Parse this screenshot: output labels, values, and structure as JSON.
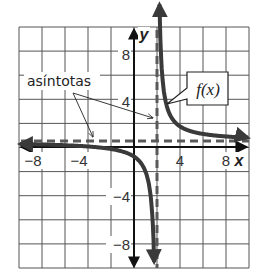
{
  "chart_data": {
    "type": "line",
    "title": "",
    "xlabel": "x",
    "ylabel": "y",
    "xlim": [
      -10,
      10
    ],
    "ylim": [
      -10,
      10
    ],
    "grid": true,
    "grid_step": 2,
    "x_ticks": [
      -8,
      -4,
      4,
      8
    ],
    "y_ticks": [
      8,
      4,
      -4,
      -8
    ],
    "x_tick_labels": [
      "−8",
      "−4",
      "4",
      "8"
    ],
    "y_tick_labels": [
      "8",
      "4",
      "−4",
      "−8"
    ],
    "series": [
      {
        "name": "f(x)",
        "style": "solid thick",
        "description": "rational function with vertical asymptote x = 2 and horizontal asymptote y ≈ 0.5",
        "approx_formula": "f(x) = 2.5/(x - 2) + 0.5",
        "points_left_branch": [
          [
            -10,
            0.29
          ],
          [
            -8,
            0.25
          ],
          [
            -4,
            0.08
          ],
          [
            -2,
            -0.13
          ],
          [
            0,
            -0.75
          ],
          [
            1,
            -2.0
          ],
          [
            1.5,
            -4.5
          ],
          [
            1.75,
            -9.5
          ]
        ],
        "points_right_branch": [
          [
            2.25,
            10.5
          ],
          [
            2.5,
            5.5
          ],
          [
            3,
            3.0
          ],
          [
            4,
            1.75
          ],
          [
            6,
            1.13
          ],
          [
            8,
            0.92
          ],
          [
            10,
            0.81
          ]
        ]
      }
    ],
    "asymptotes": [
      {
        "type": "vertical",
        "x": 2,
        "style": "dashed"
      },
      {
        "type": "horizontal",
        "y": 0.5,
        "style": "dashed"
      }
    ],
    "annotations": [
      {
        "text": "asíntotas",
        "points_to": [
          "vertical asymptote",
          "horizontal asymptote"
        ]
      },
      {
        "text": "f(x)",
        "points_to": "curve",
        "boxed": true
      }
    ],
    "legend": "none"
  },
  "labels": {
    "x_axis": "x",
    "y_axis": "y",
    "asymptotes": "asíntotas",
    "function": "f(x)",
    "x_ticks": [
      "−8",
      "−4",
      "4",
      "8"
    ],
    "y_ticks": [
      "8",
      "4",
      "−4",
      "−8"
    ]
  },
  "colors": {
    "grid": "#555555",
    "axis": "#111111",
    "curve": "#3a3a3a",
    "asymptote": "#5a5a5a"
  }
}
